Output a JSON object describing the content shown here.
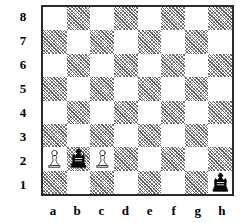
{
  "board": {
    "files": [
      "a",
      "b",
      "c",
      "d",
      "e",
      "f",
      "g",
      "h"
    ],
    "ranks": [
      "8",
      "7",
      "6",
      "5",
      "4",
      "3",
      "2",
      "1"
    ],
    "light_square_color": "#ffffff",
    "dark_square_color": "#808080",
    "border_color": "#2a2a2a",
    "orientation": "white-bottom",
    "squares": 64,
    "dark_square_style": "diagonal-hatch"
  },
  "chart_data": {
    "type": "table",
    "xlabel": "file",
    "ylabel": "rank",
    "categories": [
      "a",
      "b",
      "c",
      "d",
      "e",
      "f",
      "g",
      "h"
    ],
    "rows": [
      "8",
      "7",
      "6",
      "5",
      "4",
      "3",
      "2",
      "1"
    ],
    "pieces": [
      {
        "square": "a2",
        "file": "a",
        "rank": "2",
        "color": "white",
        "type": "pawn",
        "glyph": "white-pawn"
      },
      {
        "square": "b2",
        "file": "b",
        "rank": "2",
        "color": "black",
        "type": "king",
        "glyph": "black-king"
      },
      {
        "square": "c2",
        "file": "c",
        "rank": "2",
        "color": "white",
        "type": "pawn",
        "glyph": "white-pawn"
      },
      {
        "square": "h1",
        "file": "h",
        "rank": "1",
        "color": "black",
        "type": "king",
        "glyph": "black-king"
      }
    ],
    "piece_count": 4,
    "white_pieces": [
      "a2 pawn",
      "c2 pawn"
    ],
    "black_pieces": [
      "b2 king",
      "h1 king"
    ]
  }
}
